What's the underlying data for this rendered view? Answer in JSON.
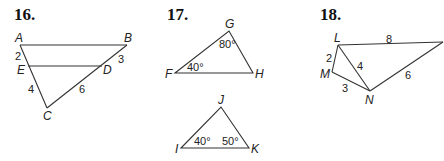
{
  "figures": [
    {
      "number": "16.",
      "vertices": {
        "A": "A",
        "B": "B",
        "C": "C",
        "D": "D",
        "E": "E"
      },
      "segments": {
        "AE": "2",
        "EC": "4",
        "BD": "3",
        "DC": "6"
      }
    },
    {
      "number": "17.",
      "triangle1": {
        "vertices": {
          "F": "F",
          "G": "G",
          "H": "H"
        },
        "angles": {
          "F": "40°",
          "G": "80°"
        }
      },
      "triangle2": {
        "vertices": {
          "I": "I",
          "J": "J",
          "K": "K"
        },
        "angles": {
          "I": "40°",
          "K": "50°"
        }
      }
    },
    {
      "number": "18.",
      "vertices": {
        "L": "L",
        "M": "M",
        "N": "N"
      },
      "segments": {
        "L_top": "8",
        "LM": "2",
        "LN": "4",
        "MN": "3",
        "N_right": "6"
      }
    }
  ]
}
